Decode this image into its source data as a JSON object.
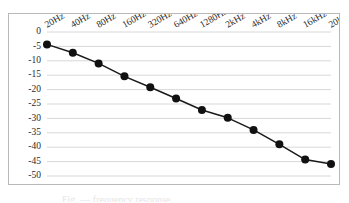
{
  "figure": {
    "caption": "Fig. — frequency response",
    "background_color": "#ffffff",
    "frame_color": "#b9b9b9"
  },
  "chart_data": {
    "type": "line",
    "title": "",
    "xlabel": "",
    "ylabel": "",
    "categories": [
      "20Hz",
      "40Hz",
      "80Hz",
      "160Hz",
      "320Hz",
      "640Hz",
      "1280Hz",
      "2kHz",
      "4kHz",
      "8kHz",
      "16kHz",
      "20kHz"
    ],
    "values": [
      -4.3,
      -7.2,
      -10.9,
      -15.4,
      -19.2,
      -23.1,
      -27.1,
      -29.8,
      -34.0,
      -39.0,
      -44.3,
      -45.8
    ],
    "ylim": [
      -50,
      0
    ],
    "yticks": [
      0,
      -5,
      -10,
      -15,
      -20,
      -25,
      -30,
      -35,
      -40,
      -45,
      -50
    ],
    "ytick_labels": [
      "0",
      "-5",
      "-10",
      "-15",
      "-20",
      "-25",
      "-30",
      "-35",
      "-40",
      "-45",
      "-50"
    ],
    "grid": true,
    "grid_axis": "y",
    "legend": false,
    "legend_position": "none",
    "xtick_rotation": -30,
    "xtick_position": "top",
    "series_color": "#111111",
    "marker": "circle",
    "marker_size": 4
  }
}
